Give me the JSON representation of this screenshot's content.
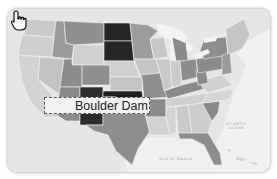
{
  "map": {
    "title": "United States map",
    "colors": {
      "background": "#e9e9e9",
      "ocean": "#eeeeee",
      "light": "#c9c9c9",
      "lighter": "#d6d6d6",
      "mid": "#9a9a9a",
      "midDark": "#858585",
      "dark": "#2a2a2a",
      "border": "#f3f3f3"
    },
    "labels": {
      "atlantic_line1": "ATLANTIC",
      "atlantic_line2": "OCEAN",
      "gulf": "Gulf of Mexico"
    }
  },
  "tooltip": {
    "text": "Boulder Dam",
    "icon": "hand-pointer-icon"
  }
}
